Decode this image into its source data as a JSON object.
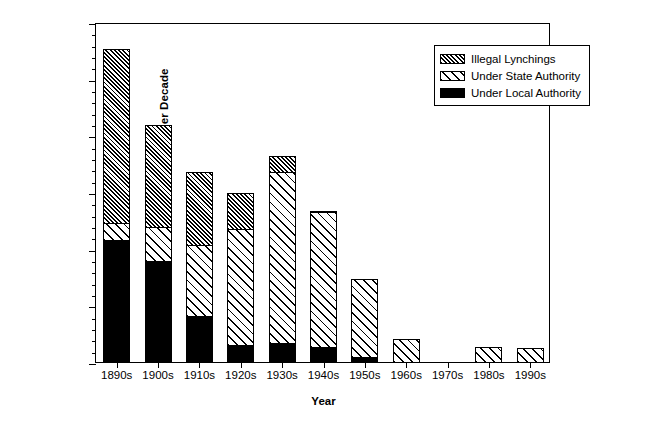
{
  "chart_data": {
    "type": "bar",
    "subtype": "stacked-bar",
    "title": "",
    "xlabel": "Year",
    "ylabel": "Total Executions per Decade",
    "categories": [
      "1890s",
      "1900s",
      "1910s",
      "1920s",
      "1930s",
      "1940s",
      "1950s",
      "1960s",
      "1970s",
      "1980s",
      "1990s"
    ],
    "series": [
      {
        "name": "Under Local Authority",
        "pattern": "solid-black",
        "values": [
          1070,
          890,
          400,
          150,
          160,
          130,
          40,
          0,
          0,
          0,
          0
        ]
      },
      {
        "name": "Under State Authority",
        "pattern": "sparse-diagonal-hatch",
        "values": [
          150,
          300,
          630,
          1020,
          1510,
          1190,
          690,
          200,
          0,
          125,
          120
        ]
      },
      {
        "name": "Illegal Lynchings",
        "pattern": "dense-diagonal-hatch",
        "values": [
          1540,
          900,
          640,
          320,
          140,
          10,
          0,
          0,
          0,
          0,
          0
        ]
      }
    ],
    "totals": [
      2760,
      2090,
      1670,
      1490,
      1810,
      1330,
      730,
      200,
      0,
      125,
      120
    ],
    "ylim": [
      0,
      3000
    ],
    "ytick_major": [
      0,
      500,
      1000,
      1500,
      2000,
      2500,
      3000
    ],
    "ytick_major_labels": [
      "0",
      "500",
      "1,000",
      "1,500",
      "2,000",
      "2,500",
      "3,000"
    ],
    "ytick_minor_step": 100,
    "grid": false,
    "legend_position": "top-right",
    "legend": [
      "Illegal Lynchings",
      "Under State Authority",
      "Under Local Authority"
    ]
  },
  "axes": {
    "y_title": "Total Executions per Decade",
    "x_title": "Year"
  }
}
